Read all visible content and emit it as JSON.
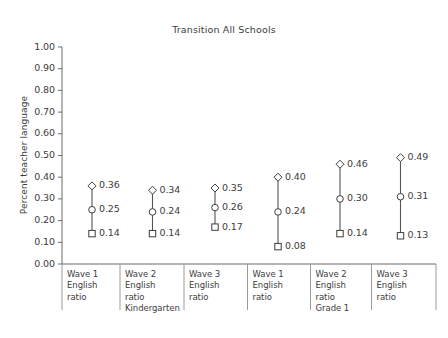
{
  "chart_data": {
    "type": "scatter",
    "title": "Transition All Schools",
    "xlabel": "",
    "ylabel": "Percent teacher language",
    "ylim": [
      0.0,
      1.0
    ],
    "ytick_labels": [
      "1.00",
      "0.90",
      "0.80",
      "0.70",
      "0.60",
      "0.50",
      "0.40",
      "0.30",
      "0.20",
      "0.10",
      "0.00"
    ],
    "ytick_values": [
      1.0,
      0.9,
      0.8,
      0.7,
      0.6,
      0.5,
      0.4,
      0.3,
      0.2,
      0.1,
      0.0
    ],
    "grid": false,
    "legend": "none",
    "marker_shapes": {
      "upper": "diamond",
      "middle": "circle",
      "lower": "square"
    },
    "categories": [
      "Wave 1 English ratio",
      "Wave 2 English ratio",
      "Wave 3 English ratio",
      "Wave 1 English ratio",
      "Wave 2 English ratio",
      "Wave 3 English ratio"
    ],
    "group_headers": [
      "Kindergarten",
      "Grade 1"
    ],
    "series": [
      {
        "name": "upper",
        "marker": "diamond",
        "values": [
          0.36,
          0.34,
          0.35,
          0.4,
          0.46,
          0.49
        ]
      },
      {
        "name": "middle",
        "marker": "circle",
        "values": [
          0.25,
          0.24,
          0.26,
          0.24,
          0.3,
          0.31
        ]
      },
      {
        "name": "lower",
        "marker": "square",
        "values": [
          0.14,
          0.14,
          0.17,
          0.08,
          0.14,
          0.13
        ]
      }
    ],
    "point_labels": {
      "upper": [
        "0.36",
        "0.34",
        "0.35",
        "0.40",
        "0.46",
        "0.49"
      ],
      "middle": [
        "0.25",
        "0.24",
        "0.26",
        "0.24",
        "0.30",
        "0.31"
      ],
      "lower": [
        "0.14",
        "0.14",
        "0.17",
        "0.08",
        "0.14",
        "0.13"
      ]
    },
    "colors": {
      "line": "#555555",
      "marker_stroke": "#3d3d3d",
      "marker_fill": "#ffffff",
      "axis": "#6b6b6b",
      "text": "#3d3d3d",
      "background": "#ffffff"
    }
  },
  "x_axis_table": {
    "cells": [
      {
        "l1": "Wave 1",
        "l2": "English",
        "l3": "ratio",
        "l4": ""
      },
      {
        "l1": "Wave 2",
        "l2": "English",
        "l3": "ratio",
        "l4": "Kindergarten"
      },
      {
        "l1": "Wave 3",
        "l2": "English",
        "l3": "ratio",
        "l4": ""
      },
      {
        "l1": "Wave 1",
        "l2": "English",
        "l3": "ratio",
        "l4": ""
      },
      {
        "l1": "Wave 2",
        "l2": "English",
        "l3": "ratio",
        "l4": "Grade 1"
      },
      {
        "l1": "Wave 3",
        "l2": "English",
        "l3": "ratio",
        "l4": ""
      }
    ]
  }
}
